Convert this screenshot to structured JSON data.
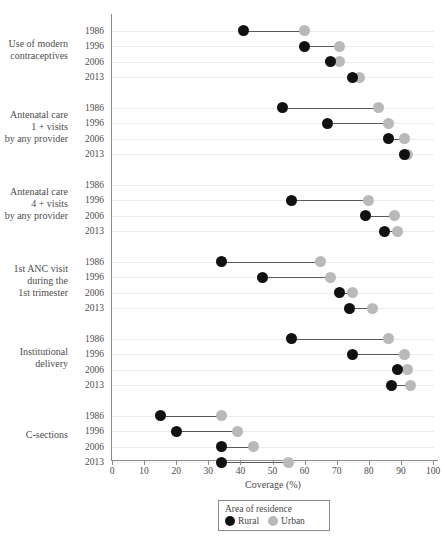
{
  "chart_data": {
    "type": "scatter",
    "subtype": "dumbbell",
    "title": "",
    "xlabel": "Coverage (%)",
    "ylabel": "",
    "xlim": [
      0,
      100
    ],
    "xticks": [
      0,
      10,
      20,
      30,
      40,
      50,
      60,
      70,
      80,
      90,
      100
    ],
    "grid": true,
    "grid_axis": "y",
    "legend": {
      "title": "Area of residence",
      "position": "bottom-center",
      "entries": [
        {
          "label": "Rural",
          "color": "#111111"
        },
        {
          "label": "Urban",
          "color": "#b9b9b9"
        }
      ]
    },
    "series": [
      {
        "name": "Rural",
        "color": "#111111"
      },
      {
        "name": "Urban",
        "color": "#b9b9b9"
      }
    ],
    "groups": [
      {
        "label_lines": [
          "Use of modern",
          "contraceptives"
        ],
        "rows": [
          {
            "year": "1986",
            "rural": 41,
            "urban": 60
          },
          {
            "year": "1996",
            "rural": 60,
            "urban": 71
          },
          {
            "year": "2006",
            "rural": 68,
            "urban": 71
          },
          {
            "year": "2013",
            "rural": 75,
            "urban": 77
          }
        ]
      },
      {
        "label_lines": [
          "Antenatal care",
          "1 + visits",
          "by any provider"
        ],
        "rows": [
          {
            "year": "1986",
            "rural": 53,
            "urban": 83
          },
          {
            "year": "1996",
            "rural": 67,
            "urban": 86
          },
          {
            "year": "2006",
            "rural": 86,
            "urban": 91
          },
          {
            "year": "2013",
            "rural": 91,
            "urban": 92
          }
        ]
      },
      {
        "label_lines": [
          "Antenatal care",
          "4 + visits",
          "by any provider"
        ],
        "rows": [
          {
            "year": "1986",
            "rural": null,
            "urban": null
          },
          {
            "year": "1996",
            "rural": 56,
            "urban": 80
          },
          {
            "year": "2006",
            "rural": 79,
            "urban": 88
          },
          {
            "year": "2013",
            "rural": 85,
            "urban": 89
          }
        ]
      },
      {
        "label_lines": [
          "1st ANC visit",
          "during the",
          "1st trimester"
        ],
        "rows": [
          {
            "year": "1986",
            "rural": 34,
            "urban": 65
          },
          {
            "year": "1996",
            "rural": 47,
            "urban": 68
          },
          {
            "year": "2006",
            "rural": 71,
            "urban": 75
          },
          {
            "year": "2013",
            "rural": 74,
            "urban": 81
          }
        ]
      },
      {
        "label_lines": [
          "Institutional",
          "delivery"
        ],
        "rows": [
          {
            "year": "1986",
            "rural": 56,
            "urban": 86
          },
          {
            "year": "1996",
            "rural": 75,
            "urban": 91
          },
          {
            "year": "2006",
            "rural": 89,
            "urban": 92
          },
          {
            "year": "2013",
            "rural": 87,
            "urban": 93
          }
        ]
      },
      {
        "label_lines": [
          "C-sections"
        ],
        "rows": [
          {
            "year": "1986",
            "rural": 15,
            "urban": 34
          },
          {
            "year": "1996",
            "rural": 20,
            "urban": 39
          },
          {
            "year": "2006",
            "rural": 34,
            "urban": 44
          },
          {
            "year": "2013",
            "rural": 34,
            "urban": 55
          }
        ]
      }
    ]
  }
}
